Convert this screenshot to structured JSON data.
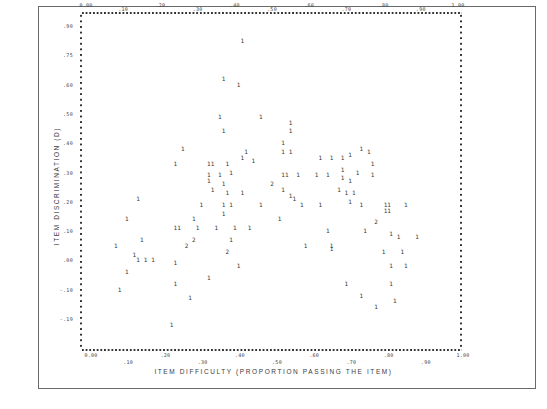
{
  "chart_data": {
    "type": "scatter",
    "title": "",
    "xlabel": "ITEM DIFFICULTY (PROPORTION PASSING THE ITEM)",
    "ylabel": "ITEM DISCRIMINATION (D)",
    "xlim": [
      0.0,
      1.0
    ],
    "ylim": [
      -0.2,
      0.9
    ],
    "grid": false,
    "x_tick_labels_top": [
      "0.00",
      ".10",
      ".20",
      ".30",
      ".40",
      ".50",
      ".60",
      ".70",
      ".80",
      ".90",
      "1.00"
    ],
    "x_tick_labels_bottom": [
      "0.00",
      ".10",
      ".20",
      ".30",
      ".40",
      ".50",
      ".60",
      ".70",
      ".80",
      ".90",
      "1.00"
    ],
    "y_tick_labels": [
      ".90",
      ".75",
      ".60",
      ".50",
      ".40",
      ".30",
      ".20",
      ".10",
      ".00",
      "-.10",
      "-.19"
    ],
    "marker_note": "Points plotted as digit characters indicating count of items at that location (1 or 2).",
    "points": [
      {
        "x": 0.42,
        "y": 0.85,
        "label": "1"
      },
      {
        "x": 0.37,
        "y": 0.72,
        "label": "1"
      },
      {
        "x": 0.41,
        "y": 0.7,
        "label": "1"
      },
      {
        "x": 0.36,
        "y": 0.59,
        "label": "1"
      },
      {
        "x": 0.47,
        "y": 0.59,
        "label": "1"
      },
      {
        "x": 0.55,
        "y": 0.57,
        "label": "1"
      },
      {
        "x": 0.37,
        "y": 0.54,
        "label": "1"
      },
      {
        "x": 0.55,
        "y": 0.54,
        "label": "1"
      },
      {
        "x": 0.53,
        "y": 0.5,
        "label": "1"
      },
      {
        "x": 0.26,
        "y": 0.48,
        "label": "1"
      },
      {
        "x": 0.43,
        "y": 0.47,
        "label": "1"
      },
      {
        "x": 0.53,
        "y": 0.47,
        "label": "1"
      },
      {
        "x": 0.55,
        "y": 0.47,
        "label": "1"
      },
      {
        "x": 0.74,
        "y": 0.48,
        "label": "1"
      },
      {
        "x": 0.76,
        "y": 0.47,
        "label": "1"
      },
      {
        "x": 0.42,
        "y": 0.45,
        "label": "1"
      },
      {
        "x": 0.45,
        "y": 0.44,
        "label": "1"
      },
      {
        "x": 0.63,
        "y": 0.45,
        "label": "1"
      },
      {
        "x": 0.66,
        "y": 0.45,
        "label": "1"
      },
      {
        "x": 0.69,
        "y": 0.45,
        "label": "1"
      },
      {
        "x": 0.71,
        "y": 0.46,
        "label": "1"
      },
      {
        "x": 0.24,
        "y": 0.43,
        "label": "1"
      },
      {
        "x": 0.33,
        "y": 0.43,
        "label": "1"
      },
      {
        "x": 0.34,
        "y": 0.43,
        "label": "1"
      },
      {
        "x": 0.38,
        "y": 0.43,
        "label": "1"
      },
      {
        "x": 0.77,
        "y": 0.43,
        "label": "1"
      },
      {
        "x": 0.33,
        "y": 0.39,
        "label": "1"
      },
      {
        "x": 0.36,
        "y": 0.39,
        "label": "1"
      },
      {
        "x": 0.39,
        "y": 0.4,
        "label": "1"
      },
      {
        "x": 0.53,
        "y": 0.39,
        "label": "1"
      },
      {
        "x": 0.54,
        "y": 0.39,
        "label": "1"
      },
      {
        "x": 0.57,
        "y": 0.39,
        "label": "1"
      },
      {
        "x": 0.62,
        "y": 0.39,
        "label": "1"
      },
      {
        "x": 0.65,
        "y": 0.39,
        "label": "1"
      },
      {
        "x": 0.69,
        "y": 0.41,
        "label": "1"
      },
      {
        "x": 0.73,
        "y": 0.4,
        "label": "1"
      },
      {
        "x": 0.33,
        "y": 0.37,
        "label": "1"
      },
      {
        "x": 0.37,
        "y": 0.36,
        "label": "1"
      },
      {
        "x": 0.5,
        "y": 0.36,
        "label": "2"
      },
      {
        "x": 0.69,
        "y": 0.38,
        "label": "1"
      },
      {
        "x": 0.71,
        "y": 0.37,
        "label": "1"
      },
      {
        "x": 0.77,
        "y": 0.39,
        "label": "1"
      },
      {
        "x": 0.14,
        "y": 0.31,
        "label": "1"
      },
      {
        "x": 0.34,
        "y": 0.34,
        "label": "1"
      },
      {
        "x": 0.38,
        "y": 0.33,
        "label": "1"
      },
      {
        "x": 0.42,
        "y": 0.33,
        "label": "1"
      },
      {
        "x": 0.53,
        "y": 0.34,
        "label": "1"
      },
      {
        "x": 0.55,
        "y": 0.32,
        "label": "1"
      },
      {
        "x": 0.56,
        "y": 0.31,
        "label": "1"
      },
      {
        "x": 0.58,
        "y": 0.29,
        "label": "1"
      },
      {
        "x": 0.68,
        "y": 0.34,
        "label": "1"
      },
      {
        "x": 0.7,
        "y": 0.33,
        "label": "1"
      },
      {
        "x": 0.72,
        "y": 0.33,
        "label": "1"
      },
      {
        "x": 0.71,
        "y": 0.3,
        "label": "1"
      },
      {
        "x": 0.31,
        "y": 0.29,
        "label": "1"
      },
      {
        "x": 0.37,
        "y": 0.29,
        "label": "1"
      },
      {
        "x": 0.39,
        "y": 0.29,
        "label": "1"
      },
      {
        "x": 0.47,
        "y": 0.29,
        "label": "1"
      },
      {
        "x": 0.63,
        "y": 0.29,
        "label": "1"
      },
      {
        "x": 0.74,
        "y": 0.29,
        "label": "1"
      },
      {
        "x": 0.81,
        "y": 0.29,
        "label": "11"
      },
      {
        "x": 0.81,
        "y": 0.27,
        "label": "11"
      },
      {
        "x": 0.86,
        "y": 0.29,
        "label": "1"
      },
      {
        "x": 0.11,
        "y": 0.24,
        "label": "1"
      },
      {
        "x": 0.29,
        "y": 0.24,
        "label": "1"
      },
      {
        "x": 0.37,
        "y": 0.26,
        "label": "1"
      },
      {
        "x": 0.52,
        "y": 0.24,
        "label": "1"
      },
      {
        "x": 0.78,
        "y": 0.23,
        "label": "2"
      },
      {
        "x": 0.24,
        "y": 0.21,
        "label": "1"
      },
      {
        "x": 0.25,
        "y": 0.21,
        "label": "1"
      },
      {
        "x": 0.3,
        "y": 0.21,
        "label": "1"
      },
      {
        "x": 0.35,
        "y": 0.21,
        "label": "1"
      },
      {
        "x": 0.4,
        "y": 0.21,
        "label": "1"
      },
      {
        "x": 0.44,
        "y": 0.21,
        "label": "1"
      },
      {
        "x": 0.65,
        "y": 0.2,
        "label": "1"
      },
      {
        "x": 0.75,
        "y": 0.2,
        "label": "1"
      },
      {
        "x": 0.82,
        "y": 0.19,
        "label": "1"
      },
      {
        "x": 0.84,
        "y": 0.18,
        "label": "1"
      },
      {
        "x": 0.89,
        "y": 0.18,
        "label": "1"
      },
      {
        "x": 0.15,
        "y": 0.17,
        "label": "1"
      },
      {
        "x": 0.29,
        "y": 0.17,
        "label": "2"
      },
      {
        "x": 0.39,
        "y": 0.17,
        "label": "1"
      },
      {
        "x": 0.08,
        "y": 0.15,
        "label": "1"
      },
      {
        "x": 0.27,
        "y": 0.15,
        "label": "2"
      },
      {
        "x": 0.59,
        "y": 0.15,
        "label": "1"
      },
      {
        "x": 0.66,
        "y": 0.15,
        "label": "1"
      },
      {
        "x": 0.66,
        "y": 0.14,
        "label": "1"
      },
      {
        "x": 0.13,
        "y": 0.12,
        "label": "1"
      },
      {
        "x": 0.38,
        "y": 0.13,
        "label": "2"
      },
      {
        "x": 0.8,
        "y": 0.13,
        "label": "1"
      },
      {
        "x": 0.85,
        "y": 0.13,
        "label": "1"
      },
      {
        "x": 0.14,
        "y": 0.1,
        "label": "1"
      },
      {
        "x": 0.16,
        "y": 0.1,
        "label": "1"
      },
      {
        "x": 0.18,
        "y": 0.1,
        "label": "1"
      },
      {
        "x": 0.24,
        "y": 0.09,
        "label": "1"
      },
      {
        "x": 0.41,
        "y": 0.08,
        "label": "1"
      },
      {
        "x": 0.82,
        "y": 0.08,
        "label": "1"
      },
      {
        "x": 0.86,
        "y": 0.08,
        "label": "1"
      },
      {
        "x": 0.11,
        "y": 0.06,
        "label": "1"
      },
      {
        "x": 0.33,
        "y": 0.04,
        "label": "1"
      },
      {
        "x": 0.24,
        "y": 0.02,
        "label": "1"
      },
      {
        "x": 0.7,
        "y": 0.02,
        "label": "1"
      },
      {
        "x": 0.82,
        "y": 0.02,
        "label": "1"
      },
      {
        "x": 0.09,
        "y": 0.0,
        "label": "1"
      },
      {
        "x": 0.74,
        "y": -0.02,
        "label": "1"
      },
      {
        "x": 0.28,
        "y": -0.03,
        "label": "1"
      },
      {
        "x": 0.83,
        "y": -0.04,
        "label": "1"
      },
      {
        "x": 0.78,
        "y": -0.06,
        "label": "1"
      },
      {
        "x": 0.23,
        "y": -0.12,
        "label": "1"
      }
    ]
  },
  "frame": {
    "border_color": "#6a6a6a",
    "background": "#ffffff",
    "ink_color": "#333333"
  }
}
